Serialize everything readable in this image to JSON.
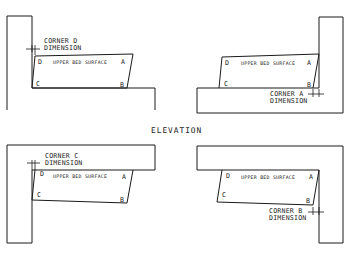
{
  "title": "ELEVATION",
  "surface_label": "UPPER BED SURFACE",
  "panels": [
    {
      "position": "top-left",
      "corner_label_line1": "CORNER D",
      "corner_label_line2": "DIMENSION",
      "corners": {
        "A": "A",
        "B": "B",
        "C": "C",
        "D": "D"
      }
    },
    {
      "position": "top-right",
      "corner_label_line1": "CORNER A",
      "corner_label_line2": "DIMENSION",
      "corners": {
        "A": "A",
        "B": "B",
        "C": "C",
        "D": "D"
      }
    },
    {
      "position": "bottom-left",
      "corner_label_line1": "CORNER C",
      "corner_label_line2": "DIMENSION",
      "corners": {
        "A": "A",
        "B": "B",
        "C": "C",
        "D": "D"
      }
    },
    {
      "position": "bottom-right",
      "corner_label_line1": "CORNER B",
      "corner_label_line2": "DIMENSION",
      "corners": {
        "A": "A",
        "B": "B",
        "C": "C",
        "D": "D"
      }
    }
  ]
}
